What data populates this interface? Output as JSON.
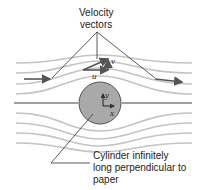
{
  "diagram": {
    "title_label": {
      "line1": "Velocity",
      "line2": "vectors"
    },
    "cylinder_label": {
      "line1": "Cylinder infinitely",
      "line2": "long perpendicular to",
      "line3": "paper"
    },
    "vector_labels": {
      "u": "u",
      "v": "v"
    },
    "axis_labels": {
      "x": "x",
      "y": "y"
    },
    "colors": {
      "streamline": "#bdbdbd",
      "cylinder_fill": "#a9a9a9",
      "cylinder_stroke": "#555555",
      "arrow": "#555555",
      "leader": "#333333",
      "text": "#222222"
    }
  }
}
